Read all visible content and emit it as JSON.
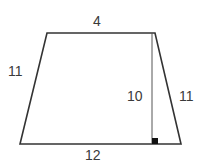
{
  "diagram": {
    "type": "trapezoid",
    "labels": {
      "top": "4",
      "bottom": "12",
      "left_side": "11",
      "right_side": "11",
      "height": "10"
    },
    "vertices": {
      "top_left": [
        47,
        33
      ],
      "top_right": [
        155,
        33
      ],
      "bottom_right": [
        181,
        144
      ],
      "bottom_left": [
        20,
        144
      ]
    },
    "height_line": {
      "x": 152,
      "y1": 33,
      "y2": 144
    },
    "right_angle_marker": {
      "x": 152,
      "y": 138,
      "size": 6
    },
    "colors": {
      "stroke": "#333333",
      "text": "#3a3a3a",
      "marker": "#111111",
      "background": "#ffffff"
    }
  }
}
